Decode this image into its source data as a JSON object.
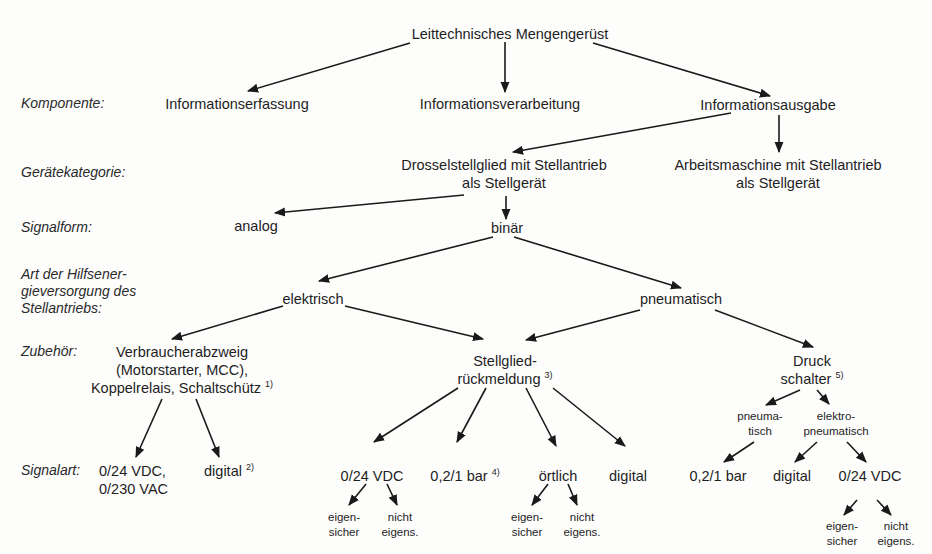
{
  "title": "Leittechnisches Mengengerüst",
  "row_labels": {
    "komponente": "Komponente:",
    "geraetekategorie": "Gerätekategorie:",
    "signalform": "Signalform:",
    "hilfsenergie_1": "Art der Hilfsener-",
    "hilfsenergie_2": "gieversorgung des",
    "hilfsenergie_3": "Stellantriebs:",
    "zubehoer": "Zubehör:",
    "signalart": "Signalart:"
  },
  "komponente": {
    "erfassung": "Informationserfassung",
    "verarbeitung": "Informationsverarbeitung",
    "ausgabe": "Informationsausgabe"
  },
  "geraetekategorie": {
    "drossel_1": "Drosselstellglied mit Stellantrieb",
    "drossel_2": "als Stellgerät",
    "arbeits_1": "Arbeitsmaschine mit Stellantrieb",
    "arbeits_2": "als Stellgerät"
  },
  "signalform": {
    "analog": "analog",
    "binaer": "binär"
  },
  "hilfsenergie": {
    "elektrisch": "elektrisch",
    "pneumatisch": "pneumatisch"
  },
  "zubehoer": {
    "verbraucher_1": "Verbraucherabzweig",
    "verbraucher_2": "(Motorstarter, MCC),",
    "verbraucher_3": "Koppelrelais, Schaltschütz",
    "verbraucher_note": "1)",
    "stellglied_1": "Stellglied-",
    "stellglied_2": "rückmeldung",
    "stellglied_note": "3)",
    "druck_1": "Druck",
    "druck_2": "schalter",
    "druck_note": "5)",
    "pneuma_1": "pneuma-",
    "pneuma_2": "tisch",
    "elektro_1": "elektro-",
    "elektro_2": "pneumatisch"
  },
  "signalart": {
    "vdc_vac_1": "0/24 VDC,",
    "vdc_vac_2": "0/230 VAC",
    "digital_1": "digital",
    "digital_1_note": "2)",
    "vdc_2": "0/24 VDC",
    "bar_1": "0,2/1 bar",
    "bar_1_note": "4)",
    "oertlich": "örtlich",
    "digital_2": "digital",
    "bar_2": "0,2/1 bar",
    "digital_3": "digital",
    "vdc_3": "0/24 VDC"
  },
  "sicherheit": {
    "eigen_1": "eigen-",
    "eigen_2": "sicher",
    "nicht_1": "nicht",
    "nicht_2": "eigens."
  },
  "colors": {
    "background": "#fdfdfc",
    "text": "#1e1e1e",
    "arrow": "#1a1a1a"
  }
}
